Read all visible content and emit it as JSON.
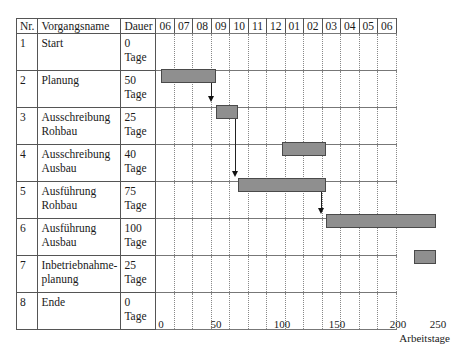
{
  "table": {
    "headers": {
      "nr": "Nr.",
      "name": "Vorgangsname",
      "duration": "Dauer"
    },
    "months": [
      "06",
      "07",
      "08",
      "09",
      "10",
      "11",
      "12",
      "01",
      "02",
      "03",
      "04",
      "05",
      "06"
    ],
    "rows": [
      {
        "nr": "1",
        "name": "Start",
        "name2": "",
        "dur": "0",
        "unit": "Tage"
      },
      {
        "nr": "2",
        "name": "Planung",
        "name2": "",
        "dur": "50",
        "unit": "Tage"
      },
      {
        "nr": "3",
        "name": "Ausschreibung",
        "name2": "Rohbau",
        "dur": "25",
        "unit": "Tage"
      },
      {
        "nr": "4",
        "name": "Ausschreibung",
        "name2": "Ausbau",
        "dur": "40",
        "unit": "Tage"
      },
      {
        "nr": "5",
        "name": "Ausführung",
        "name2": "Rohbau",
        "dur": "75",
        "unit": "Tage"
      },
      {
        "nr": "6",
        "name": "Ausführung",
        "name2": "Ausbau",
        "dur": "100",
        "unit": "Tage"
      },
      {
        "nr": "7",
        "name": "Inbetriebnahme-",
        "name2": "planung",
        "dur": "25",
        "unit": "Tage"
      },
      {
        "nr": "8",
        "name": "Ende",
        "name2": "",
        "dur": "0",
        "unit": "Tage"
      }
    ]
  },
  "axis": {
    "ticks": [
      "0",
      "50",
      "100",
      "150",
      "200",
      "250"
    ],
    "xlabel": "Arbeitstage"
  },
  "colors": {
    "bar": "#8f8f8f",
    "bar_border": "#4a4a4a",
    "grid": "#555555"
  },
  "chart_data": {
    "type": "gantt",
    "title": "",
    "xlabel": "Arbeitstage",
    "ylabel": "",
    "xlim": [
      0,
      250
    ],
    "x_ticks": [
      0,
      50,
      100,
      150,
      200,
      250
    ],
    "top_axis_months": [
      "06",
      "07",
      "08",
      "09",
      "10",
      "11",
      "12",
      "01",
      "02",
      "03",
      "04",
      "05",
      "06"
    ],
    "grid": true,
    "tasks": [
      {
        "nr": 1,
        "name": "Start",
        "duration_days": 0,
        "start": 0,
        "end": 0
      },
      {
        "nr": 2,
        "name": "Planung",
        "duration_days": 50,
        "start": 0,
        "end": 50
      },
      {
        "nr": 3,
        "name": "Ausschreibung Rohbau",
        "duration_days": 25,
        "start": 50,
        "end": 70
      },
      {
        "nr": 4,
        "name": "Ausschreibung Ausbau",
        "duration_days": 40,
        "start": 110,
        "end": 150
      },
      {
        "nr": 5,
        "name": "Ausführung Rohbau",
        "duration_days": 75,
        "start": 70,
        "end": 150
      },
      {
        "nr": 6,
        "name": "Ausführung Ausbau",
        "duration_days": 100,
        "start": 150,
        "end": 250
      },
      {
        "nr": 7,
        "name": "Inbetriebnahmeplanung",
        "duration_days": 25,
        "start": 230,
        "end": 250
      },
      {
        "nr": 8,
        "name": "Ende",
        "duration_days": 0,
        "start": 250,
        "end": 250
      }
    ],
    "dependencies": [
      {
        "from": 2,
        "to": 3
      },
      {
        "from": 3,
        "to": 5
      },
      {
        "from": 5,
        "to": 6
      }
    ]
  }
}
